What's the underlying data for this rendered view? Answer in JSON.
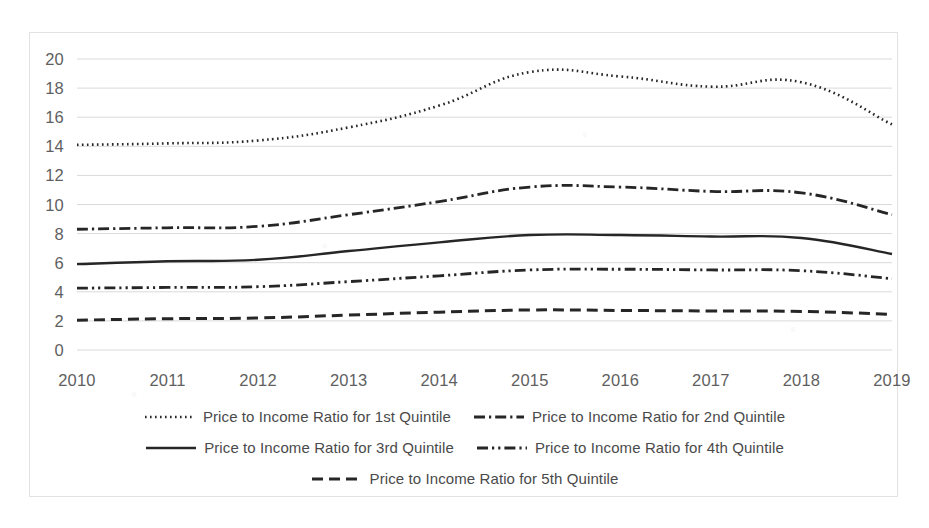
{
  "chart_data": {
    "type": "line",
    "title": "",
    "xlabel": "",
    "ylabel": "",
    "categories": [
      "2010",
      "2011",
      "2012",
      "2013",
      "2014",
      "2015",
      "2016",
      "2017",
      "2018",
      "2019"
    ],
    "x": [
      2010,
      2011,
      2012,
      2013,
      2014,
      2015,
      2016,
      2017,
      2018,
      2019
    ],
    "ylim": [
      0,
      20
    ],
    "ytick_values": [
      0,
      2,
      4,
      6,
      8,
      10,
      12,
      14,
      16,
      18,
      20
    ],
    "ytick_labels": [
      "0",
      "2",
      "4",
      "6",
      "8",
      "10",
      "12",
      "14",
      "16",
      "18",
      "20"
    ],
    "grid": true,
    "legend_position": "bottom",
    "series": [
      {
        "name": "Price to Income Ratio for 1st Quintile",
        "style": "dotted",
        "color": "#262626",
        "values": [
          14.1,
          14.2,
          14.4,
          15.3,
          16.8,
          19.1,
          18.8,
          18.1,
          18.4,
          15.5
        ]
      },
      {
        "name": "Price to Income Ratio for 2nd Quintile",
        "style": "dash-dot",
        "color": "#262626",
        "values": [
          8.3,
          8.4,
          8.5,
          9.3,
          10.2,
          11.2,
          11.2,
          10.9,
          10.8,
          9.3
        ]
      },
      {
        "name": "Price to Income Ratio for 3rd Quintile",
        "style": "solid",
        "color": "#262626",
        "values": [
          5.9,
          6.1,
          6.2,
          6.8,
          7.4,
          7.9,
          7.9,
          7.8,
          7.7,
          6.6
        ]
      },
      {
        "name": "Price to Income Ratio for 4th Quintile",
        "style": "dash-dot-dot",
        "color": "#262626",
        "values": [
          4.25,
          4.3,
          4.35,
          4.7,
          5.1,
          5.5,
          5.55,
          5.5,
          5.45,
          4.9
        ]
      },
      {
        "name": "Price to Income Ratio for 5th Quintile",
        "style": "dashed",
        "color": "#262626",
        "values": [
          2.05,
          2.15,
          2.2,
          2.4,
          2.6,
          2.75,
          2.72,
          2.68,
          2.65,
          2.45
        ]
      }
    ]
  }
}
